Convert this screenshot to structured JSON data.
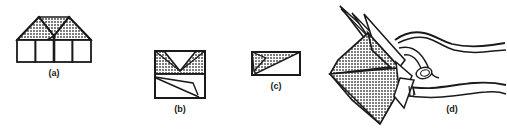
{
  "plate": {
    "name": "origami-folding-sequence-plate",
    "width": 507,
    "height": 129,
    "background_color": "#ffffff",
    "line_color": "#1a1a1a",
    "shade_color": "#8c8c8c",
    "paper_color": "#ffffff"
  },
  "captions": {
    "a": "(a)",
    "b": "(b)",
    "c": "(c)",
    "d": "(d)"
  },
  "figures": [
    {
      "id": "a",
      "label": "(a)",
      "description": "Wide flat preliminary fold: shaded double-peaked roof band above four white rectangular panels",
      "shaded_regions": 3,
      "white_panels": 4
    },
    {
      "id": "b",
      "label": "(b)",
      "description": "Square step: shaded upper half with inverted V notch, white lower half with diagonal crease lines",
      "shaded_regions": 2,
      "white_panels": 1
    },
    {
      "id": "c",
      "label": "(c)",
      "description": "Small rectangle with shaded triangle occupying upper-left diagonal half",
      "shaded_regions": 2,
      "white_panels": 1
    },
    {
      "id": "d",
      "label": "(d)",
      "description": "Finished shaded origami bird form held between thumb and fingers of a hand",
      "shaded_regions": 4,
      "white_panels": 3
    }
  ]
}
